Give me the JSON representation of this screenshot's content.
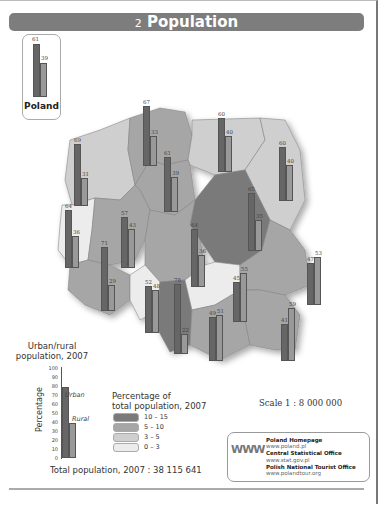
{
  "header": {
    "number": "2",
    "title": "Population"
  },
  "poland_summary": {
    "label": "Poland",
    "urban": 61,
    "rural": 39
  },
  "chart_data": {
    "type": "bar",
    "title": "Population",
    "subtitle": "Urban/rural population, 2007 (grouped bars over choropleth map of Polish voivodeships)",
    "xlabel": "",
    "ylabel": "Percentage",
    "ylim": [
      0,
      100
    ],
    "categories": [
      "Poland",
      "Zachodniopomorskie",
      "Pomorskie",
      "Warminsko-Mazurskie",
      "Podlaskie",
      "Kujawsko-Pomorskie",
      "Lubuskie",
      "Wielkopolskie",
      "Mazowieckie",
      "Lodzkie",
      "Dolnoslaskie",
      "Opolskie",
      "Slaskie",
      "Swietokrzyskie",
      "Malopolskie",
      "Lubelskie",
      "Podkarpackie"
    ],
    "series": [
      {
        "name": "Urban",
        "values": [
          61,
          69,
          67,
          60,
          60,
          61,
          64,
          57,
          65,
          64,
          71,
          52,
          78,
          45,
          49,
          47,
          41
        ]
      },
      {
        "name": "Rural",
        "values": [
          39,
          31,
          33,
          40,
          40,
          39,
          36,
          43,
          35,
          36,
          29,
          48,
          22,
          55,
          51,
          53,
          59
        ]
      }
    ],
    "choropleth_legend": {
      "title": "Percentage of total population, 2007",
      "classes": [
        {
          "range": "10 – 15",
          "color": "#7a7a7a"
        },
        {
          "range": "5 – 10",
          "color": "#a6a6a6"
        },
        {
          "range": "3 – 5",
          "color": "#cfcfcf"
        },
        {
          "range": "0 – 3",
          "color": "#ececec"
        }
      ]
    },
    "bar_legend": {
      "title": "Urban/rural population, 2007",
      "axis_label": "Percentage",
      "ticks": [
        "100",
        "90",
        "80",
        "70",
        "60",
        "50",
        "40",
        "30",
        "20",
        "10",
        "0"
      ],
      "urban_label": "Urban",
      "rural_label": "Rural"
    },
    "legend_position": "bottom-left",
    "grid": false
  },
  "regions": [
    {
      "name": "Zachodniopomorskie",
      "urban": 69,
      "rural": 31
    },
    {
      "name": "Pomorskie",
      "urban": 67,
      "rural": 33
    },
    {
      "name": "Warminsko-Mazurskie",
      "urban": 60,
      "rural": 40
    },
    {
      "name": "Podlaskie",
      "urban": 60,
      "rural": 40
    },
    {
      "name": "Kujawsko-Pomorskie",
      "urban": 61,
      "rural": 39
    },
    {
      "name": "Lubuskie",
      "urban": 64,
      "rural": 36
    },
    {
      "name": "Wielkopolskie",
      "urban": 57,
      "rural": 43
    },
    {
      "name": "Mazowieckie",
      "urban": 65,
      "rural": 35
    },
    {
      "name": "Lodzkie",
      "urban": 64,
      "rural": 36
    },
    {
      "name": "Dolnoslaskie",
      "urban": 71,
      "rural": 29
    },
    {
      "name": "Opolskie",
      "urban": 52,
      "rural": 48
    },
    {
      "name": "Slaskie",
      "urban": 78,
      "rural": 22
    },
    {
      "name": "Swietokrzyskie",
      "urban": 45,
      "rural": 55
    },
    {
      "name": "Malopolskie",
      "urban": 49,
      "rural": 51
    },
    {
      "name": "Lubelskie",
      "urban": 47,
      "rural": 53
    },
    {
      "name": "Podkarpackie",
      "urban": 41,
      "rural": 59
    }
  ],
  "legend": {
    "bar_title_1": "Urban/rural",
    "bar_title_2": "population, 2007",
    "axis_label": "Percentage",
    "urban": "Urban",
    "rural": "Rural",
    "choro_title_1": "Percentage of",
    "choro_title_2": "total population, 2007",
    "classes": [
      "10 – 15",
      "5 – 10",
      "3 – 5",
      "0 – 3"
    ]
  },
  "scale": "Scale 1 : 8 000 000",
  "total_population": "Total population, 2007 : 38 115 641",
  "links": {
    "icon_text": "WWW",
    "items": [
      {
        "title": "Poland Homepage",
        "url": "www.poland.pl"
      },
      {
        "title": "Central Statistical Office",
        "url": "www.stat.gov.pl"
      },
      {
        "title": "Polish National Tourist Office",
        "url": "www.polandtour.org"
      }
    ]
  }
}
